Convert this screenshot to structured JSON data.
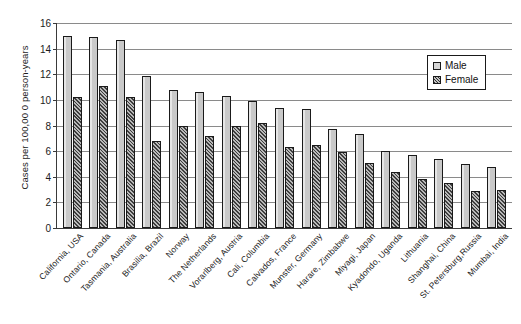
{
  "chart_data": {
    "type": "bar",
    "title": "",
    "subtitle": "",
    "xlabel": "",
    "ylabel": "Cases per 100,00 0 person-years",
    "ylim": [
      0,
      16
    ],
    "yticks": [
      0,
      2,
      4,
      6,
      8,
      10,
      12,
      14,
      16
    ],
    "grid": true,
    "legend_position": "top-right",
    "legend": [
      "Male",
      "Female"
    ],
    "categories": [
      "California, USA",
      "Ontario, Canada",
      "Tasmania, Australia",
      "Brasilia, Brazil",
      "Norway",
      "The Netherlands",
      "Vorarlberg, Austria",
      "Cali, Columbia",
      "Calvados, France",
      "Munster, Germany",
      "Harare, Zimbabwe",
      "Miyagi, Japan",
      "Kyadondo, Uganda",
      "Lithuania",
      "Shanghai, China",
      "St. Petersburg,Russia",
      "Mumbai, India"
    ],
    "series": [
      {
        "name": "Male",
        "color": "#cfcfcf",
        "values": [
          15.0,
          14.9,
          14.7,
          11.9,
          10.8,
          10.6,
          10.3,
          9.9,
          9.4,
          9.3,
          7.7,
          7.3,
          6.0,
          5.7,
          5.4,
          5.0,
          4.8
        ]
      },
      {
        "name": "Female",
        "color": "#6e6e6e",
        "values": [
          10.2,
          11.1,
          10.2,
          6.8,
          8.0,
          7.2,
          8.0,
          8.2,
          6.3,
          6.5,
          5.9,
          5.1,
          4.4,
          3.8,
          3.5,
          2.9,
          3.0
        ]
      }
    ]
  }
}
